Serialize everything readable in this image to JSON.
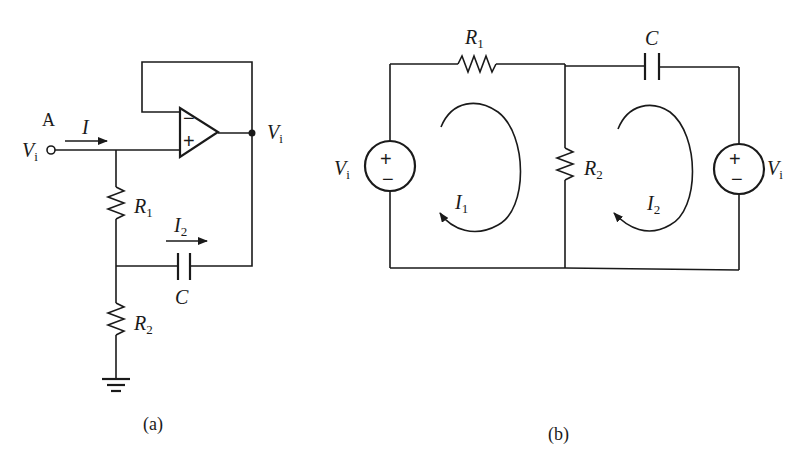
{
  "figure_a": {
    "caption": "(a)",
    "node_label": "A",
    "input_voltage": {
      "main": "V",
      "sub": "i"
    },
    "output_voltage": {
      "main": "V",
      "sub": "i"
    },
    "input_current": "I",
    "branch_current": {
      "main": "I",
      "sub": "2"
    },
    "resistor_1": {
      "main": "R",
      "sub": "1"
    },
    "resistor_2": {
      "main": "R",
      "sub": "2"
    },
    "capacitor": "C",
    "opamp": {
      "inverting": "−",
      "non_inverting": "+"
    }
  },
  "figure_b": {
    "caption": "(b)",
    "resistor_1": {
      "main": "R",
      "sub": "1"
    },
    "resistor_2": {
      "main": "R",
      "sub": "2"
    },
    "capacitor": "C",
    "source_left": {
      "main": "V",
      "sub": "i",
      "plus": "+",
      "minus": "−"
    },
    "source_right": {
      "main": "V",
      "sub": "i",
      "plus": "+",
      "minus": "−"
    },
    "loop_current_1": {
      "main": "I",
      "sub": "1"
    },
    "loop_current_2": {
      "main": "I",
      "sub": "2"
    }
  }
}
